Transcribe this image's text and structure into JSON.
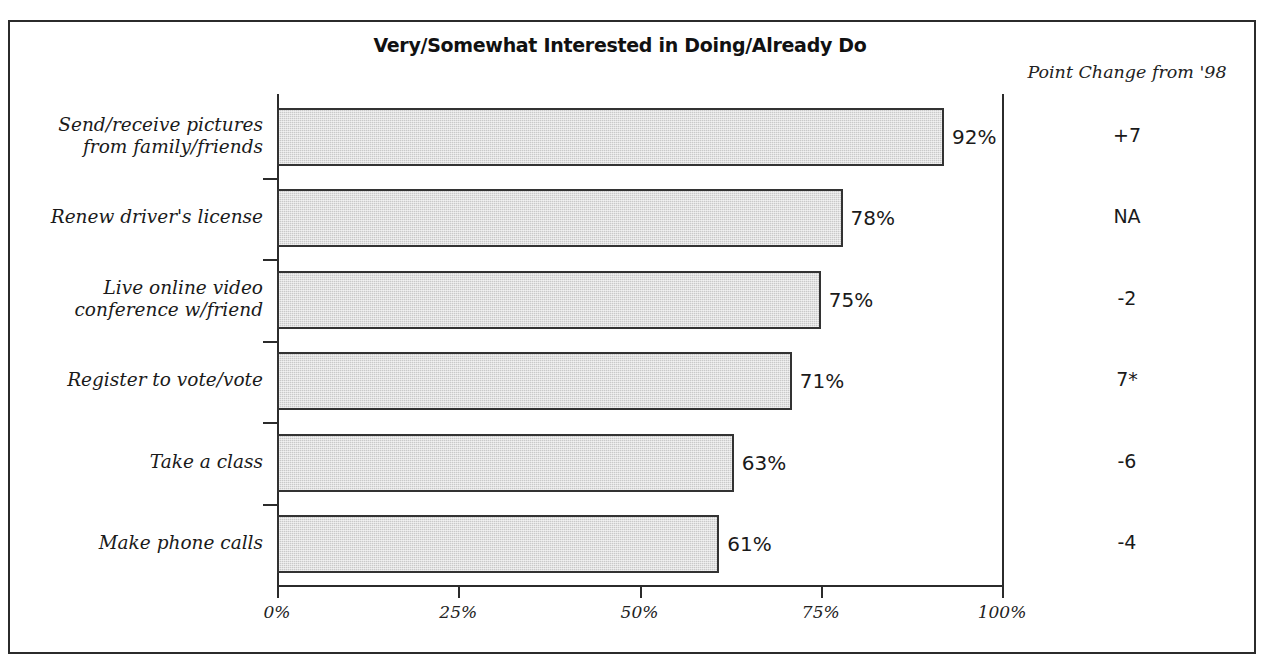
{
  "chart_data": {
    "type": "bar",
    "orientation": "horizontal",
    "title": "Very/Somewhat Interested in Doing/Already Do",
    "xlabel": "",
    "ylabel": "",
    "xlim": [
      0,
      100
    ],
    "grid": false,
    "legend": null,
    "xtick_labels": [
      "0%",
      "25%",
      "50%",
      "75%",
      "100%"
    ],
    "xtick_values": [
      0,
      25,
      50,
      75,
      100
    ],
    "categories": [
      "Send/receive pictures from family/friends",
      "Renew driver's license",
      "Live online video conference w/friend",
      "Register to vote/vote",
      "Take a class",
      "Make phone calls"
    ],
    "values": [
      92,
      78,
      75,
      71,
      63,
      61
    ],
    "value_labels": [
      "92%",
      "78%",
      "75%",
      "71%",
      "63%",
      "61%"
    ],
    "annotations": {
      "column_header": "Point Change from '98",
      "column_values": [
        "+7",
        "NA",
        "-2",
        "7*",
        "-6",
        "-4"
      ]
    }
  },
  "categories_display": [
    {
      "line1": "Send/receive pictures",
      "line2": "from family/friends"
    },
    {
      "line1": "Renew driver's license",
      "line2": ""
    },
    {
      "line1": "Live online video",
      "line2": "conference w/friend"
    },
    {
      "line1": "Register to vote/vote",
      "line2": ""
    },
    {
      "line1": "Take a class",
      "line2": ""
    },
    {
      "line1": "Make phone calls",
      "line2": ""
    }
  ],
  "colors": {
    "bar_fill": "#c9c9c9",
    "bar_stroke": "#333333",
    "axis": "#2b2b2b",
    "frame": "#2b2b2b",
    "text": "#1a1a1a",
    "background": "#ffffff"
  }
}
